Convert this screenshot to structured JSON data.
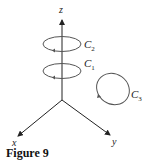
{
  "figure": {
    "caption": "Figure 9",
    "axes": {
      "z_label": "z",
      "x_label": "x",
      "y_label": "y"
    },
    "curves": [
      {
        "label": "C",
        "subscript": "2",
        "description": "horizontal loop around z-axis, upper"
      },
      {
        "label": "C",
        "subscript": "1",
        "description": "horizontal loop around z-axis, lower"
      },
      {
        "label": "C",
        "subscript": "3",
        "description": "loop not enclosing z-axis"
      }
    ],
    "colors": {
      "line": "#222222",
      "curve": "#555555"
    }
  }
}
